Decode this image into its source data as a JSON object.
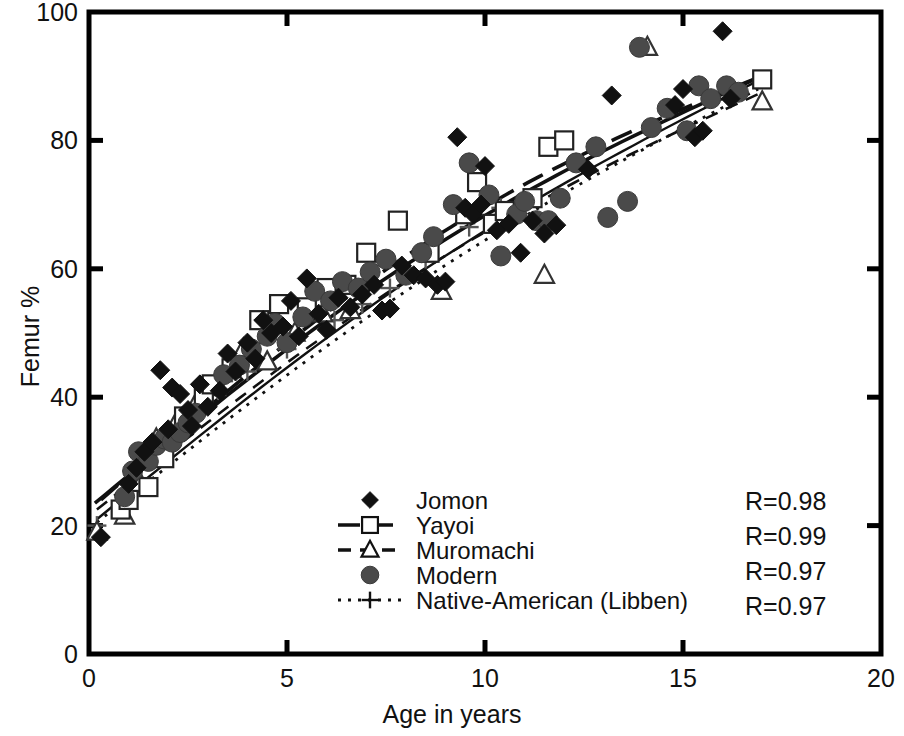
{
  "chart_data": {
    "type": "scatter",
    "title": "",
    "xlabel": "Age in years",
    "ylabel": "Femur %",
    "xlim": [
      0,
      20
    ],
    "ylim": [
      0,
      100
    ],
    "xticks": [
      0,
      5,
      10,
      15,
      20
    ],
    "yticks": [
      0,
      20,
      40,
      60,
      80,
      100
    ],
    "grid": false,
    "legend_position": "inside-bottom-center",
    "series": [
      {
        "name": "Jomon",
        "marker": "filled-diamond",
        "color": "#111111",
        "line_style": "solid",
        "R": "R=0.98",
        "points": [
          [
            0.3,
            18.2
          ],
          [
            1.0,
            26.5
          ],
          [
            1.2,
            29.0
          ],
          [
            1.4,
            31.5
          ],
          [
            1.6,
            33.0
          ],
          [
            1.8,
            44.2
          ],
          [
            2.0,
            35.0
          ],
          [
            2.1,
            41.5
          ],
          [
            2.3,
            40.5
          ],
          [
            2.5,
            38.0
          ],
          [
            2.6,
            35.5
          ],
          [
            2.8,
            42.0
          ],
          [
            3.0,
            38.5
          ],
          [
            3.3,
            41.0
          ],
          [
            3.5,
            46.8
          ],
          [
            3.7,
            44.0
          ],
          [
            4.0,
            48.5
          ],
          [
            4.2,
            46.0
          ],
          [
            4.4,
            52.0
          ],
          [
            4.6,
            50.0
          ],
          [
            4.9,
            51.0
          ],
          [
            5.1,
            55.0
          ],
          [
            5.3,
            49.5
          ],
          [
            5.5,
            58.5
          ],
          [
            5.8,
            53.0
          ],
          [
            6.0,
            50.5
          ],
          [
            6.3,
            55.5
          ],
          [
            6.6,
            54.0
          ],
          [
            6.9,
            56.0
          ],
          [
            7.2,
            57.5
          ],
          [
            7.4,
            53.5
          ],
          [
            7.6,
            53.8
          ],
          [
            7.9,
            60.5
          ],
          [
            8.2,
            59.0
          ],
          [
            8.5,
            58.5
          ],
          [
            8.8,
            57.5
          ],
          [
            9.0,
            58.0
          ],
          [
            9.3,
            80.5
          ],
          [
            9.5,
            69.5
          ],
          [
            9.7,
            68.5
          ],
          [
            9.9,
            70.0
          ],
          [
            10.0,
            76.0
          ],
          [
            10.3,
            66.0
          ],
          [
            10.6,
            67.0
          ],
          [
            10.9,
            62.5
          ],
          [
            11.2,
            67.5
          ],
          [
            11.5,
            65.5
          ],
          [
            11.8,
            66.8
          ],
          [
            12.6,
            75.5
          ],
          [
            13.2,
            87.0
          ],
          [
            14.8,
            85.5
          ],
          [
            15.0,
            88.0
          ],
          [
            15.3,
            80.5
          ],
          [
            15.5,
            81.5
          ],
          [
            16.0,
            97.0
          ],
          [
            16.2,
            86.5
          ]
        ]
      },
      {
        "name": "Yayoi",
        "marker": "open-square",
        "color": "#222222",
        "line_style": "long-dash",
        "R": "R=0.99",
        "points": [
          [
            0.8,
            22.5
          ],
          [
            1.0,
            24.0
          ],
          [
            1.5,
            26.0
          ],
          [
            1.9,
            30.5
          ],
          [
            2.4,
            37.0
          ],
          [
            2.9,
            40.0
          ],
          [
            3.1,
            42.0
          ],
          [
            3.6,
            44.5
          ],
          [
            4.3,
            52.0
          ],
          [
            4.8,
            54.5
          ],
          [
            5.5,
            54.0
          ],
          [
            6.0,
            57.0
          ],
          [
            6.5,
            57.5
          ],
          [
            7.0,
            62.5
          ],
          [
            7.8,
            67.5
          ],
          [
            8.6,
            62.5
          ],
          [
            9.5,
            68.5
          ],
          [
            9.8,
            73.5
          ],
          [
            10.2,
            67.0
          ],
          [
            10.5,
            69.0
          ],
          [
            11.2,
            71.0
          ],
          [
            11.6,
            79.0
          ],
          [
            12.0,
            80.0
          ],
          [
            17.0,
            89.5
          ]
        ]
      },
      {
        "name": "Muromachi",
        "marker": "open-triangle",
        "color": "#333333",
        "line_style": "dash",
        "R": "R=0.97",
        "points": [
          [
            0.2,
            19.0
          ],
          [
            0.9,
            21.5
          ],
          [
            1.3,
            26.5
          ],
          [
            1.7,
            33.5
          ],
          [
            2.2,
            36.0
          ],
          [
            2.7,
            39.0
          ],
          [
            3.2,
            41.5
          ],
          [
            3.9,
            47.5
          ],
          [
            4.5,
            45.5
          ],
          [
            5.2,
            50.0
          ],
          [
            5.9,
            53.0
          ],
          [
            6.6,
            53.5
          ],
          [
            8.9,
            56.5
          ],
          [
            11.5,
            59.0
          ],
          [
            14.1,
            94.5
          ],
          [
            17.0,
            86.0
          ]
        ]
      },
      {
        "name": "Modern",
        "marker": "filled-circle",
        "color": "#4a4a4a",
        "line_style": "solid",
        "R": "R=0.97",
        "points": [
          [
            0.9,
            24.5
          ],
          [
            1.1,
            28.5
          ],
          [
            1.25,
            31.5
          ],
          [
            1.5,
            30.0
          ],
          [
            1.7,
            32.5
          ],
          [
            1.9,
            33.5
          ],
          [
            2.1,
            33.0
          ],
          [
            2.3,
            34.5
          ],
          [
            2.5,
            36.0
          ],
          [
            2.7,
            37.5
          ],
          [
            3.4,
            43.5
          ],
          [
            3.8,
            45.0
          ],
          [
            4.1,
            47.5
          ],
          [
            4.5,
            49.5
          ],
          [
            4.7,
            51.5
          ],
          [
            5.0,
            48.5
          ],
          [
            5.4,
            52.5
          ],
          [
            5.7,
            56.5
          ],
          [
            6.1,
            55.0
          ],
          [
            6.4,
            58.0
          ],
          [
            6.8,
            57.0
          ],
          [
            7.1,
            59.5
          ],
          [
            7.5,
            61.5
          ],
          [
            8.0,
            59.0
          ],
          [
            8.4,
            62.5
          ],
          [
            8.7,
            65.0
          ],
          [
            9.2,
            70.0
          ],
          [
            9.6,
            76.5
          ],
          [
            10.1,
            71.5
          ],
          [
            10.4,
            62.0
          ],
          [
            10.8,
            68.5
          ],
          [
            11.0,
            70.5
          ],
          [
            11.3,
            67.5
          ],
          [
            11.6,
            67.5
          ],
          [
            11.9,
            71.0
          ],
          [
            12.3,
            76.5
          ],
          [
            12.8,
            79.0
          ],
          [
            13.1,
            68.0
          ],
          [
            13.6,
            70.5
          ],
          [
            13.9,
            94.5
          ],
          [
            14.2,
            82.0
          ],
          [
            14.6,
            85.0
          ],
          [
            15.1,
            81.5
          ],
          [
            15.4,
            88.5
          ],
          [
            15.7,
            86.5
          ],
          [
            16.1,
            88.5
          ],
          [
            16.4,
            87.5
          ]
        ]
      },
      {
        "name": "Native-American (Libben)",
        "marker": "plus",
        "color": "#555555",
        "line_style": "dotted",
        "R": "",
        "points": [
          [
            0.2,
            20.0
          ],
          [
            2.0,
            34.0
          ],
          [
            3.4,
            42.5
          ],
          [
            4.0,
            44.0
          ],
          [
            5.0,
            47.5
          ],
          [
            6.2,
            52.0
          ],
          [
            6.9,
            54.5
          ],
          [
            7.6,
            57.0
          ],
          [
            8.5,
            61.5
          ],
          [
            9.6,
            66.5
          ],
          [
            10.4,
            69.5
          ]
        ]
      }
    ],
    "regression_lines": [
      {
        "name": "Jomon",
        "style": "solid",
        "x0": 0.15,
        "y0": 23.5,
        "x1": 16.8,
        "y1": 89.5,
        "curve": 6.0
      },
      {
        "name": "Yayoi",
        "style": "long-dash",
        "x0": 0.3,
        "y0": 24.0,
        "x1": 16.9,
        "y1": 89.8,
        "curve": 7.5
      },
      {
        "name": "Muromachi",
        "style": "dash",
        "x0": 0.2,
        "y0": 22.5,
        "x1": 17.0,
        "y1": 87.5,
        "curve": 5.5
      },
      {
        "name": "Modern",
        "style": "solid-thin",
        "x0": 0.2,
        "y0": 21.0,
        "x1": 16.8,
        "y1": 89.0,
        "curve": 5.0
      },
      {
        "name": "Native-American (Libben)",
        "style": "dotted",
        "x0": 0.2,
        "y0": 20.5,
        "x1": 16.9,
        "y1": 88.0,
        "curve": 4.5
      }
    ],
    "legend_entries": [
      {
        "label": "Jomon",
        "marker": "filled-diamond",
        "line": "none"
      },
      {
        "label": "Yayoi",
        "marker": "open-square",
        "line": "long-dash"
      },
      {
        "label": "Muromachi",
        "marker": "open-triangle",
        "line": "dash"
      },
      {
        "label": "Modern",
        "marker": "filled-circle",
        "line": "none"
      },
      {
        "label": "Native-American (Libben)",
        "marker": "plus",
        "line": "dotted"
      }
    ],
    "annotations": [
      {
        "text": "R=0.98"
      },
      {
        "text": "R=0.99"
      },
      {
        "text": "R=0.97"
      },
      {
        "text": "R=0.97"
      }
    ]
  },
  "axes": {
    "x_tick_labels": [
      "0",
      "5",
      "10",
      "15",
      "20"
    ],
    "y_tick_labels": [
      "0",
      "20",
      "40",
      "60",
      "80",
      "100"
    ],
    "x_title": "Age in years",
    "y_title": "Femur %"
  }
}
